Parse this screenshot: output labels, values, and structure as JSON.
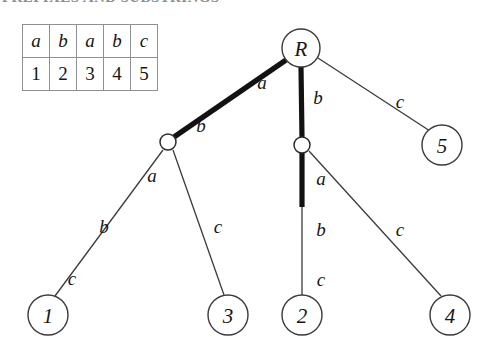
{
  "title": {
    "text": "PREFIXES AND SUBSTRINGS",
    "clipped": true
  },
  "colors": {
    "background": "#ffffff",
    "ink": "#161616",
    "thin_edge": "#3a3a3f",
    "thick_edge": "#121212",
    "table_border": "#8f8f95",
    "title_ghost": "#8c8c93"
  },
  "string_table": {
    "rows": [
      {
        "type": "letters",
        "cells": [
          "a",
          "b",
          "a",
          "b",
          "c"
        ]
      },
      {
        "type": "indices",
        "cells": [
          "1",
          "2",
          "3",
          "4",
          "5"
        ]
      }
    ]
  },
  "tree": {
    "nodes": [
      {
        "id": "root",
        "label": "R",
        "kind": "big",
        "cx": 301,
        "cy": 48,
        "r": 19
      },
      {
        "id": "n-left",
        "label": "",
        "kind": "small",
        "cx": 168,
        "cy": 142,
        "r": 8
      },
      {
        "id": "n-right",
        "label": "",
        "kind": "small",
        "cx": 302,
        "cy": 145,
        "r": 8
      },
      {
        "id": "leaf-1",
        "label": "1",
        "kind": "big",
        "cx": 48,
        "cy": 315,
        "r": 20
      },
      {
        "id": "leaf-3",
        "label": "3",
        "kind": "big",
        "cx": 228,
        "cy": 315,
        "r": 20
      },
      {
        "id": "leaf-2",
        "label": "2",
        "kind": "big",
        "cx": 302,
        "cy": 315,
        "r": 20
      },
      {
        "id": "leaf-4",
        "label": "4",
        "kind": "big",
        "cx": 450,
        "cy": 315,
        "r": 20
      },
      {
        "id": "leaf-5",
        "label": "5",
        "kind": "big",
        "cx": 442,
        "cy": 145,
        "r": 20
      }
    ],
    "edges": [
      {
        "id": "root-a",
        "from": "root",
        "to": "n-left",
        "weight": "thick",
        "labels": [
          "a",
          "b"
        ]
      },
      {
        "id": "root-b",
        "from": "root",
        "to": "n-right",
        "weight": "thick",
        "labels": [
          "b"
        ]
      },
      {
        "id": "root-c",
        "from": "root",
        "to": "leaf-5",
        "weight": "thin",
        "labels": [
          "c"
        ]
      },
      {
        "id": "left-to-1",
        "from": "n-left",
        "to": "leaf-1",
        "weight": "thin",
        "labels": [
          "a",
          "b",
          "c"
        ]
      },
      {
        "id": "left-to-3",
        "from": "n-left",
        "to": "leaf-3",
        "weight": "thin",
        "labels": [
          "c"
        ]
      },
      {
        "id": "right-to-2",
        "from": "n-right",
        "to": "leaf-2",
        "weight": "mixed",
        "labels": [
          "a",
          "b",
          "c"
        ]
      },
      {
        "id": "right-to-4",
        "from": "n-right",
        "to": "leaf-4",
        "weight": "thin",
        "labels": [
          "c"
        ]
      }
    ],
    "edge_labels": [
      {
        "id": "lbl-root-a",
        "text": "a",
        "x": 262,
        "y": 89
      },
      {
        "id": "lbl-left-b",
        "text": "b",
        "x": 201,
        "y": 132
      },
      {
        "id": "lbl-root-b",
        "text": "b",
        "x": 318,
        "y": 104
      },
      {
        "id": "lbl-root-c",
        "text": "c",
        "x": 400,
        "y": 108
      },
      {
        "id": "lbl-left-a",
        "text": "a",
        "x": 152,
        "y": 182
      },
      {
        "id": "lbl-left-lb",
        "text": "b",
        "x": 104,
        "y": 233
      },
      {
        "id": "lbl-left-lc",
        "text": "c",
        "x": 72,
        "y": 285
      },
      {
        "id": "lbl-left-rc",
        "text": "c",
        "x": 218,
        "y": 233
      },
      {
        "id": "lbl-right-a",
        "text": "a",
        "x": 321,
        "y": 185
      },
      {
        "id": "lbl-right-b",
        "text": "b",
        "x": 321,
        "y": 236
      },
      {
        "id": "lbl-right-c",
        "text": "c",
        "x": 321,
        "y": 286
      },
      {
        "id": "lbl-right-rc",
        "text": "c",
        "x": 400,
        "y": 236
      }
    ]
  }
}
